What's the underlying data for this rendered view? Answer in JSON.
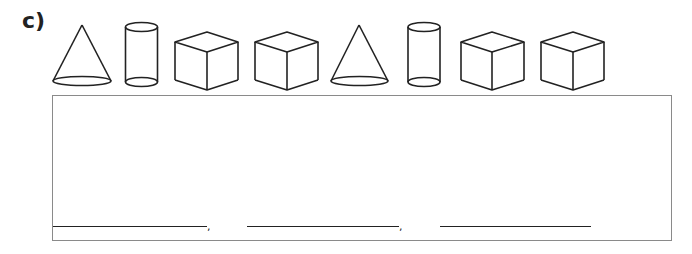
{
  "question": {
    "label": "c)",
    "shapes": [
      "cone",
      "cylinder",
      "cube",
      "cube",
      "cone",
      "cylinder",
      "cube",
      "cube"
    ]
  },
  "answer_area": {
    "blanks": [
      {
        "separator": ","
      },
      {
        "separator": ","
      },
      {
        "separator": ""
      }
    ]
  },
  "colors": {
    "stroke": "#222222",
    "box_border": "#8a8a8a"
  }
}
